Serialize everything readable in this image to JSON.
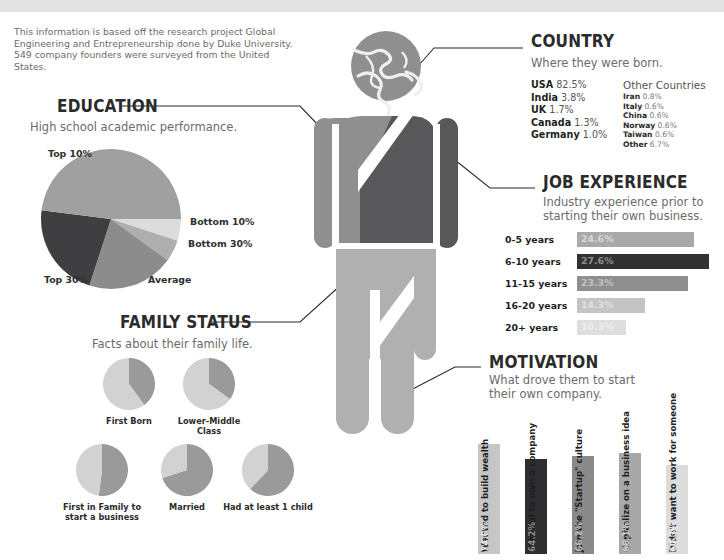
{
  "theme": {
    "topbar": "#e4e4e4",
    "dark": "#58585a",
    "mid": "#8c8c8c",
    "light": "#b0b0b0",
    "lighter": "#cfcfcf",
    "lightest": "#e2e2e2",
    "ink": "#2b2b2b",
    "body": "#6b6b6b"
  },
  "intro": {
    "text": "This information is based off the research project Global Engineering and Entrepreneurship done by Duke University. 549 company founders were surveyed from the United States."
  },
  "figure": {
    "head_icon": "globe-icon"
  },
  "country": {
    "title": "COUNTRY",
    "subtitle": "Where they were born.",
    "main": [
      {
        "name": "USA",
        "value": "82.5%"
      },
      {
        "name": "India",
        "value": "3.8%"
      },
      {
        "name": "UK",
        "value": "1.7%"
      },
      {
        "name": "Canada",
        "value": "1.3%"
      },
      {
        "name": "Germany",
        "value": "1.0%"
      }
    ],
    "other_heading": "Other Countries",
    "other": [
      {
        "name": "Iran",
        "value": "0.8%"
      },
      {
        "name": "Italy",
        "value": "0.6%"
      },
      {
        "name": "China",
        "value": "0.6%"
      },
      {
        "name": "Norway",
        "value": "0.6%"
      },
      {
        "name": "Taiwan",
        "value": "0.6%"
      },
      {
        "name": "Other",
        "value": "6.7%"
      }
    ]
  },
  "education": {
    "title": "EDUCATION",
    "subtitle": "High school academic performance."
  },
  "job_experience": {
    "title": "JOB EXPERIENCE",
    "subtitle": "Industry experience prior to starting their own business."
  },
  "family_status": {
    "title": "FAMILY STATUS",
    "subtitle": "Facts about their family life."
  },
  "motivation": {
    "title": "MOTIVATION",
    "subtitle": "What drove them to start their own company."
  },
  "chart_data": [
    {
      "id": "education_pie",
      "type": "pie",
      "title": "High school academic performance.",
      "labels": [
        "Bottom 10%",
        "Bottom 30%",
        "Average",
        "Top 30%",
        "Top 10%"
      ],
      "values": [
        5,
        5,
        20,
        22,
        48
      ],
      "colors": [
        "#dcdcdc",
        "#aeaeae",
        "#8c8c8c",
        "#3f3f41",
        "#a0a0a0"
      ],
      "legend": "callout-labels"
    },
    {
      "id": "job_experience_bars",
      "type": "bar",
      "title": "Industry experience prior to starting their own business.",
      "orientation": "horizontal",
      "categories": [
        "0-5 years",
        "6-10 years",
        "11-15 years",
        "16-20 years",
        "20+ years"
      ],
      "values": [
        24.6,
        27.6,
        23.3,
        14.3,
        10.3
      ],
      "value_labels": [
        "24.6%",
        "27.6%",
        "23.3%",
        "14.3%",
        "10.3%"
      ],
      "colors": [
        "#a9a9a9",
        "#313133",
        "#8f8f8f",
        "#c4c4c4",
        "#dedede"
      ],
      "value_text_colors": [
        "#d8d8d8",
        "#8e8e8e",
        "#c2c2c2",
        "#e0e0e0",
        "#efefef"
      ],
      "xlabel": "",
      "ylabel": "",
      "xlim": [
        0,
        30
      ],
      "grid": false
    },
    {
      "id": "family_status_pies",
      "type": "pie",
      "title": "Facts about their family life.",
      "pies": [
        {
          "label": "First Born",
          "value": 40,
          "colors": [
            "#9a9a9a",
            "#d2d2d2"
          ]
        },
        {
          "label": "Lower-Middle Class",
          "value": 35,
          "colors": [
            "#9a9a9a",
            "#d2d2d2"
          ]
        },
        {
          "label": "First in Family to start a business",
          "value": 52,
          "colors": [
            "#9a9a9a",
            "#d2d2d2"
          ]
        },
        {
          "label": "Married",
          "value": 70,
          "colors": [
            "#9a9a9a",
            "#d2d2d2"
          ]
        },
        {
          "label": "Had at least 1 child",
          "value": 62,
          "colors": [
            "#9a9a9a",
            "#d2d2d2"
          ]
        }
      ]
    },
    {
      "id": "motivation_bars",
      "type": "bar",
      "title": "What drove them to start their own company.",
      "orientation": "vertical",
      "categories": [
        "Wanted to build wealth",
        "Wanted to own a company",
        "Join the \"Startup\" culture",
        "Capitalize on a business idea",
        "Didn't want to work for someone"
      ],
      "values": [
        74.6,
        64.2,
        66.2,
        68.1,
        60.3
      ],
      "value_labels": [
        "74.6%",
        "64.2%",
        "66.2%",
        "68.1%",
        "60.3%"
      ],
      "colors": [
        "#c6c6c6",
        "#2e2e30",
        "#8a8a8a",
        "#a8a8a8",
        "#dcdcdc"
      ],
      "value_text_colors": [
        "#e4e4e4",
        "#8a8a8a",
        "#b8b8b8",
        "#cdcdcd",
        "#ebebeb"
      ],
      "ylim": [
        0,
        100
      ],
      "grid": false
    }
  ]
}
